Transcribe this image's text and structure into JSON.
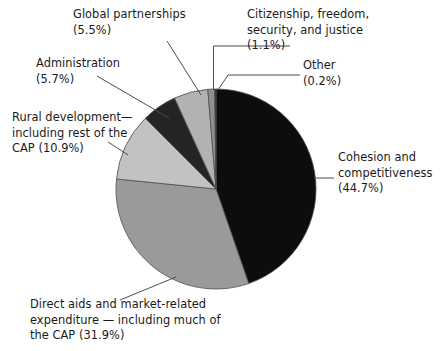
{
  "chart_data": {
    "type": "pie",
    "title": "",
    "subtitle": "",
    "xlabel": "",
    "ylabel": "",
    "legend_position": "none",
    "grid": false,
    "units": "percent",
    "start_angle_deg": 0,
    "direction": "clockwise",
    "categories": [
      "Cohesion and competitiveness",
      "Direct aids and market-related expenditure — including much of the CAP",
      "Rural development—including rest of the CAP",
      "Administration",
      "Global partnerships",
      "Citizenship, freedom, security, and justice",
      "Other"
    ],
    "values": [
      44.7,
      31.9,
      10.9,
      5.7,
      5.5,
      1.1,
      0.2
    ],
    "slices": [
      {
        "key": "cohesion",
        "name": "Cohesion and competitiveness",
        "value": 44.7,
        "value_text": "(44.7%)",
        "color": "#0d0d0d",
        "label_lines": "Cohesion and\ncompetitiveness\n(44.7%)"
      },
      {
        "key": "direct-aids",
        "name": "Direct aids and market-related expenditure — including much of the CAP",
        "value": 31.9,
        "value_text": "(31.9%)",
        "color": "#9a9a9a",
        "label_lines": "Direct aids and market-related\nexpenditure — including much of\nthe CAP (31.9%)"
      },
      {
        "key": "rural-development",
        "name": "Rural development—including rest of the CAP",
        "value": 10.9,
        "value_text": "(10.9%)",
        "color": "#c2c2c2",
        "label_lines": "Rural development—\nincluding rest of the\nCAP (10.9%)"
      },
      {
        "key": "administration",
        "name": "Administration",
        "value": 5.7,
        "value_text": "(5.7%)",
        "color": "#242424",
        "label_lines": "Administration\n(5.7%)"
      },
      {
        "key": "global-partnerships",
        "name": "Global partnerships",
        "value": 5.5,
        "value_text": "(5.5%)",
        "color": "#b2b2b2",
        "label_lines": "Global partnerships\n(5.5%)"
      },
      {
        "key": "citizenship",
        "name": "Citizenship, freedom, security, and justice",
        "value": 1.1,
        "value_text": "(1.1%)",
        "color": "#8f8f8f",
        "label_lines": "Citizenship, freedom,\nsecurity, and justice\n(1.1%)"
      },
      {
        "key": "other",
        "name": "Other",
        "value": 0.2,
        "value_text": "(0.2%)",
        "color": "#2b2b2b",
        "label_lines": "Other\n(0.2%)"
      }
    ],
    "geometry": {
      "center_x": 216,
      "center_y": 189,
      "radius": 100
    },
    "colors": {
      "background": "#ffffff",
      "text": "#1a1a1a",
      "leader_line": "#4d4d4d",
      "slice_outline": "#4d4d4d"
    }
  }
}
